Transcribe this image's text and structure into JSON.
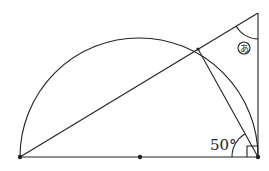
{
  "diagram": {
    "type": "geometry",
    "points": {
      "left_end": [
        20,
        157
      ],
      "center": [
        140,
        157
      ],
      "right_end": [
        258,
        157
      ],
      "top_of_tangent": [
        258,
        13
      ],
      "arc_point": [
        198,
        49
      ]
    },
    "radius": 119,
    "labels": {
      "given_angle": "50°",
      "unknown_angle": "あ"
    },
    "colors": {
      "stroke": "#222222",
      "background": "#ffffff"
    }
  }
}
